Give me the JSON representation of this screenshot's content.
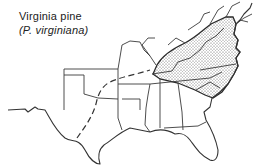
{
  "map": {
    "title": "Virginia pine",
    "subtitle": "(P. virginiana)",
    "region": "Eastern United States",
    "legend": {
      "stippled_area": "natural range",
      "dashed_line": "range boundary (western extension)"
    },
    "colors": {
      "background": "#ffffff",
      "lines": "#333333",
      "stipple": "#555555"
    }
  }
}
